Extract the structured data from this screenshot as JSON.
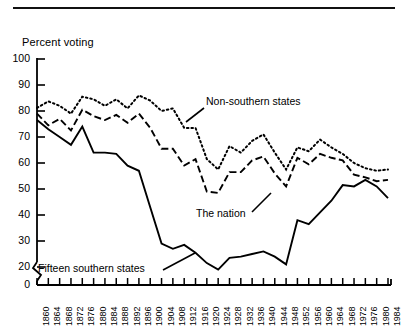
{
  "figure": {
    "axis_title": "Percent voting",
    "has_top_rule": true,
    "line_color": "#000000",
    "background": "#ffffff"
  },
  "annotations": [
    {
      "name": "non-southern-states",
      "text": "Non-southern states"
    },
    {
      "name": "the-nation",
      "text": "The nation"
    },
    {
      "name": "fifteen-southern-states",
      "text": "Fifteen southern states"
    }
  ],
  "chart_data": {
    "type": "line",
    "title": "",
    "subtitle": "",
    "xlabel": "",
    "ylabel": "Percent voting",
    "xlim": [
      1860,
      1984
    ],
    "ylim": [
      0,
      100
    ],
    "y_axis_break": true,
    "y_break_between": [
      0,
      20
    ],
    "grid": false,
    "legend": "inline-annotations",
    "yticks": [
      0,
      20,
      30,
      40,
      50,
      60,
      70,
      80,
      90,
      100
    ],
    "ytick_labels": [
      "0",
      "20",
      "30",
      "40",
      "50",
      "60",
      "70",
      "80",
      "90",
      "100"
    ],
    "x": [
      1860,
      1864,
      1868,
      1872,
      1876,
      1880,
      1884,
      1888,
      1892,
      1896,
      1900,
      1904,
      1908,
      1912,
      1916,
      1920,
      1924,
      1928,
      1932,
      1936,
      1940,
      1944,
      1948,
      1952,
      1956,
      1960,
      1964,
      1968,
      1972,
      1976,
      1980,
      1984
    ],
    "xtick_labels": [
      "1860",
      "1864",
      "1868",
      "1872",
      "1876",
      "1880",
      "1884",
      "1888",
      "1892",
      "1896",
      "1900",
      "1904",
      "1908",
      "1912",
      "1916",
      "1920",
      "1924",
      "1928",
      "1932",
      "1936",
      "1940",
      "1944",
      "1948",
      "1952",
      "1956",
      "1960",
      "1964",
      "1968",
      "1972",
      "1976",
      "1980",
      "1984"
    ],
    "series": [
      {
        "name": "Non-southern states",
        "style": "dotted",
        "values": [
          81.2,
          83.7,
          82.0,
          79.0,
          85.5,
          84.5,
          82.0,
          84.5,
          81.0,
          86.0,
          84.0,
          80.0,
          81.0,
          73.5,
          73.5,
          61.5,
          57.5,
          66.5,
          64.0,
          68.5,
          71.0,
          64.0,
          57.5,
          66.0,
          64.5,
          69.0,
          66.0,
          63.5,
          60.0,
          58.0,
          57.0,
          57.5
        ]
      },
      {
        "name": "The nation",
        "style": "dashed",
        "values": [
          79.0,
          74.5,
          77.0,
          72.5,
          80.5,
          78.0,
          76.5,
          78.5,
          75.5,
          79.0,
          73.5,
          65.5,
          65.5,
          59.0,
          61.5,
          49.0,
          48.5,
          56.5,
          56.5,
          61.0,
          62.5,
          56.0,
          51.0,
          62.0,
          59.5,
          63.5,
          62.0,
          61.0,
          55.5,
          54.5,
          53.0,
          53.5
        ]
      },
      {
        "name": "Fifteen southern states",
        "style": "solid",
        "values": [
          76.5,
          73.0,
          70.0,
          67.0,
          74.0,
          64.0,
          64.0,
          63.5,
          59.0,
          57.0,
          43.0,
          29.0,
          27.0,
          28.5,
          25.5,
          21.5,
          19.0,
          23.5,
          24.0,
          25.0,
          26.0,
          24.0,
          21.0,
          38.0,
          36.5,
          41.0,
          45.5,
          51.5,
          51.0,
          53.5,
          51.0,
          46.5
        ]
      }
    ]
  }
}
